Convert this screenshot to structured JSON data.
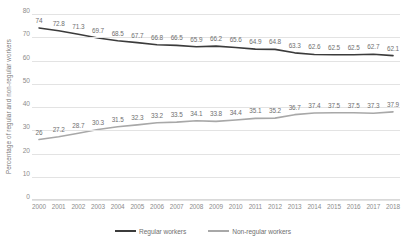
{
  "chart_data": {
    "type": "line",
    "title": "",
    "xlabel": "",
    "ylabel": "Percentage of regular and non-regular workers",
    "ylim": [
      0,
      80
    ],
    "ytick_labels": [
      "0",
      "10",
      "20",
      "30",
      "40",
      "50",
      "60",
      "70",
      "80"
    ],
    "yticks": [
      0,
      10,
      20,
      30,
      40,
      50,
      60,
      70,
      80
    ],
    "grid": true,
    "legend_position": "bottom",
    "categories": [
      "2000",
      "2001",
      "2002",
      "2003",
      "2004",
      "2005",
      "2006",
      "2007",
      "2008",
      "2009",
      "2010",
      "2011",
      "2012",
      "2013",
      "2014",
      "2015",
      "2016",
      "2017",
      "2018"
    ],
    "series": [
      {
        "name": "Regular workers",
        "color": "#3b3b3b",
        "values": [
          74,
          72.8,
          71.3,
          69.7,
          68.5,
          67.7,
          66.8,
          66.5,
          65.9,
          66.2,
          65.6,
          64.9,
          64.8,
          63.3,
          62.6,
          62.5,
          62.5,
          62.7,
          62.1
        ],
        "labels": [
          "74",
          "72.8",
          "71.3",
          "69.7",
          "68.5",
          "67.7",
          "66.8",
          "66.5",
          "65.9",
          "66.2",
          "65.6",
          "64.9",
          "64.8",
          "63.3",
          "62.6",
          "62.5",
          "62.5",
          "62.7",
          "62.1"
        ]
      },
      {
        "name": "Non-regular workers",
        "color": "#a8a8a8",
        "values": [
          26,
          27.2,
          28.7,
          30.3,
          31.5,
          32.3,
          33.2,
          33.5,
          34.1,
          33.8,
          34.4,
          35.1,
          35.2,
          36.7,
          37.4,
          37.5,
          37.5,
          37.3,
          37.9
        ],
        "labels": [
          "26",
          "27.2",
          "28.7",
          "30.3",
          "31.5",
          "32.3",
          "33.2",
          "33.5",
          "34.1",
          "33.8",
          "34.4",
          "35.1",
          "35.2",
          "36.7",
          "37.4",
          "37.5",
          "37.5",
          "37.3",
          "37.9"
        ]
      }
    ]
  },
  "legend": {
    "entries": [
      {
        "label": "Regular workers",
        "color": "#3b3b3b"
      },
      {
        "label": "Non-regular workers",
        "color": "#a8a8a8"
      }
    ]
  },
  "colors": {
    "regular": "#3b3b3b",
    "non_regular": "#a8a8a8",
    "gridline": "#e3e3e3",
    "tick_text": "#8c8c8c",
    "label_text": "#6f6f6f"
  }
}
